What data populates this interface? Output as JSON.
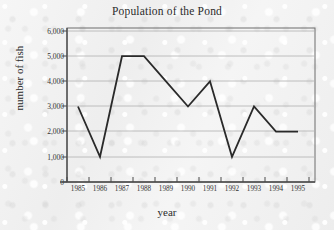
{
  "chart_data": {
    "type": "line",
    "title": "Population of the Pond",
    "xlabel": "year",
    "ylabel": "number of fish",
    "categories": [
      "1985",
      "1986",
      "1987",
      "1988",
      "1989",
      "1990",
      "1991",
      "1992",
      "1993",
      "1994",
      "1995"
    ],
    "values": [
      3000,
      1000,
      5000,
      5000,
      4000,
      3000,
      4000,
      1000,
      3000,
      2000,
      2000
    ],
    "series": [
      {
        "name": "number of fish",
        "values": [
          3000,
          1000,
          5000,
          5000,
          4000,
          3000,
          4000,
          1000,
          3000,
          2000,
          2000
        ]
      }
    ],
    "ylim": [
      0,
      6000
    ],
    "ytick_labels": [
      "0",
      "1,000",
      "2,000",
      "3,000",
      "4,000",
      "5,000",
      "6,000"
    ],
    "ytick_values": [
      0,
      1000,
      2000,
      3000,
      4000,
      5000,
      6000
    ],
    "grid": true,
    "legend": "none",
    "markers": false,
    "line_color": "#2a2a2a",
    "grid_color": "#b6b6b6",
    "axis_color": "#555555",
    "background_color": "#f1f1f1"
  }
}
